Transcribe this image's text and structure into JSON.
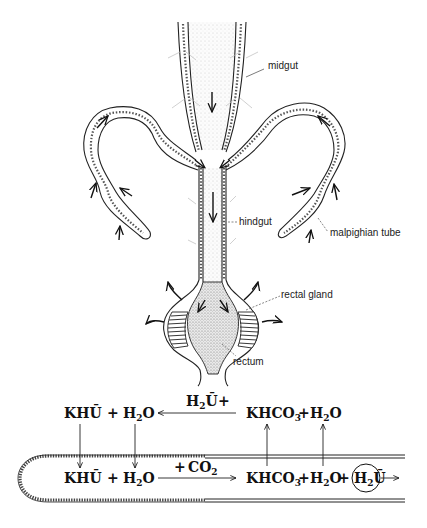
{
  "figure": {
    "type": "anatomical-diagram"
  },
  "labels": {
    "midgut": "midgut",
    "hindgut": "hindgut",
    "malpighian_tube": "malpighian tube",
    "rectal_gland": "rectal gland",
    "rectum": "rectum"
  },
  "reactions": {
    "top_row": {
      "left_term_1": "KHŪ",
      "plus_1": "+",
      "left_term_2_main": "H",
      "left_term_2_sub": "2",
      "left_term_2_end": "O",
      "arrow_label_main": "H",
      "arrow_label_sub": "2",
      "arrow_label_end": "Ū",
      "arrow_label_plus": "+",
      "right_term_1_main": "KHCO",
      "right_term_1_sub": "3",
      "plus_2": "+",
      "right_term_2_main": "H",
      "right_term_2_sub": "2",
      "right_term_2_end": "O"
    },
    "bottom_row": {
      "term_1": "KHŪ",
      "plus_1": "+",
      "term_2_main": "H",
      "term_2_sub": "2",
      "term_2_end": "O",
      "arrow_label_plus": "+",
      "arrow_label_main": "CO",
      "arrow_label_sub": "2",
      "term_3_main": "KHCO",
      "term_3_sub": "3",
      "plus_2": "+",
      "term_4_main": "H",
      "term_4_sub": "2",
      "term_4_end": "O",
      "plus_3": "+",
      "circled_main": "H",
      "circled_sub": "2",
      "circled_end": "Ū"
    }
  },
  "colors": {
    "ink": "#111111",
    "background": "#ffffff"
  }
}
